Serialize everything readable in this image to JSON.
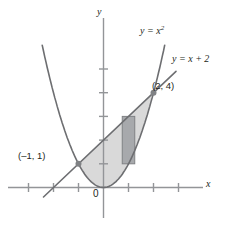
{
  "figure": {
    "labels": {
      "parabola": "y = x",
      "parabola_exponent": "2",
      "line": "y = x + 2",
      "x_axis": "x",
      "y_axis": "y",
      "origin": "0",
      "point_a": "(–1, 1)",
      "point_b": "(2, 4)"
    },
    "colors": {
      "curve": "#6d6e71",
      "axis": "#939598",
      "region_fill": "#d9d9d9",
      "rect_fill": "#a7a9ac",
      "rect_stroke": "#808285",
      "point_dot": "#808285",
      "text": "#231f20",
      "background": "#ffffff"
    }
  },
  "chart_data": {
    "type": "line",
    "title": "",
    "xlabel": "x",
    "ylabel": "y",
    "xlim": [
      -3,
      4
    ],
    "ylim": [
      -1,
      6.4
    ],
    "grid": false,
    "legend": "inline-curve-labels",
    "series": [
      {
        "name": "y = x^2",
        "type": "parabola",
        "equation": "y = x^2",
        "x": [
          -2.4,
          -2,
          -1.5,
          -1,
          -0.5,
          0,
          0.5,
          1,
          1.5,
          2,
          2.4
        ],
        "values": [
          5.76,
          4,
          2.25,
          1,
          0.25,
          0,
          0.25,
          1,
          2.25,
          4,
          5.76
        ]
      },
      {
        "name": "y = x + 2",
        "type": "line",
        "equation": "y = x + 2",
        "x": [
          -2.4,
          0,
          2,
          2.9
        ],
        "values": [
          -0.4,
          2,
          4,
          4.9
        ]
      }
    ],
    "annotations": [
      {
        "label": "(–1, 1)",
        "x": -1,
        "y": 1,
        "marker": "dot"
      },
      {
        "label": "(2, 4)",
        "x": 2,
        "y": 4,
        "marker": "dot"
      },
      {
        "label": "y = x²",
        "x": 2.1,
        "y": 6.0,
        "marker": "text"
      },
      {
        "label": "y = x + 2",
        "x": 3.0,
        "y": 5.1,
        "marker": "text"
      },
      {
        "label": "0",
        "x": 0,
        "y": 0,
        "marker": "text"
      }
    ],
    "shaded_regions": [
      {
        "name": "area-between-curves",
        "between": [
          "y = x + 2",
          "y = x^2"
        ],
        "x_from": -1,
        "x_to": 2,
        "fill": "#d9d9d9"
      },
      {
        "name": "representative-rectangle",
        "x_left": 0.75,
        "x_right": 1.25,
        "y_bottom": 1.0,
        "y_top": 3.0,
        "fill": "#a7a9ac"
      }
    ],
    "x_ticks": [
      -3,
      -2,
      -1,
      1,
      2,
      3
    ],
    "y_ticks": [
      1,
      2,
      3,
      4,
      5
    ]
  }
}
